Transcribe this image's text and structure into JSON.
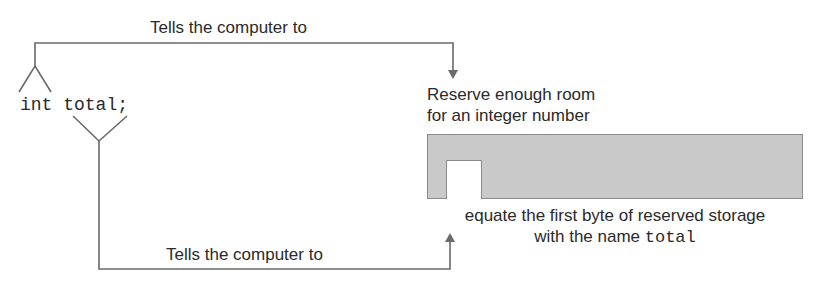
{
  "diagram": {
    "top_caption": "Tells the computer to",
    "bottom_caption": "Tells the computer to",
    "code": {
      "type_keyword": "int",
      "identifier": "total;"
    },
    "reserve_text": {
      "line1": "Reserve enough room",
      "line2": "for an integer number"
    },
    "equate_text": {
      "line1": "equate the first byte of reserved storage",
      "line2_prefix": "with the name ",
      "line2_code": "total"
    },
    "colors": {
      "line": "#6a6a6a",
      "storage_fill": "#c9c9c9",
      "byte_fill": "#ffffff",
      "text": "#2a2a2a"
    }
  }
}
